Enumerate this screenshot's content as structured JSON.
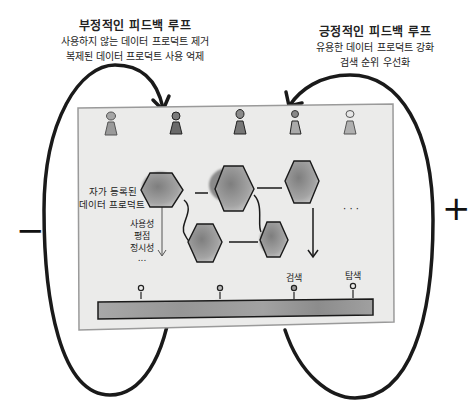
{
  "negative_loop": {
    "title": "부정적인 피드백 루프",
    "lines": [
      "사용하지 않는 데이터 프로덕트 제거",
      "복제된 데이터 프로덕트 사용 억제"
    ],
    "sign": "−"
  },
  "positive_loop": {
    "title": "긍정적인 피드백 루프",
    "lines": [
      "유용한 데이터 프로덕트 강화",
      "검색 순위 우선화"
    ],
    "sign": "+"
  },
  "panel": {
    "self_registered_label": [
      "자가 등록된",
      "데이터 프로덕트"
    ],
    "attributes": [
      "사용성",
      "평점",
      "정시성",
      "..."
    ],
    "ellipsis": "· · ·",
    "users_count": 5,
    "bar_labels": [
      "",
      "",
      "검색",
      "탐색"
    ]
  },
  "colors": {
    "panel_bg": "#ebebea",
    "panel_border": "#9a9a9a",
    "hex_fill": "#8d8d8d",
    "stroke": "#1a1a1a",
    "bar_fill": "#9c9c9c"
  }
}
